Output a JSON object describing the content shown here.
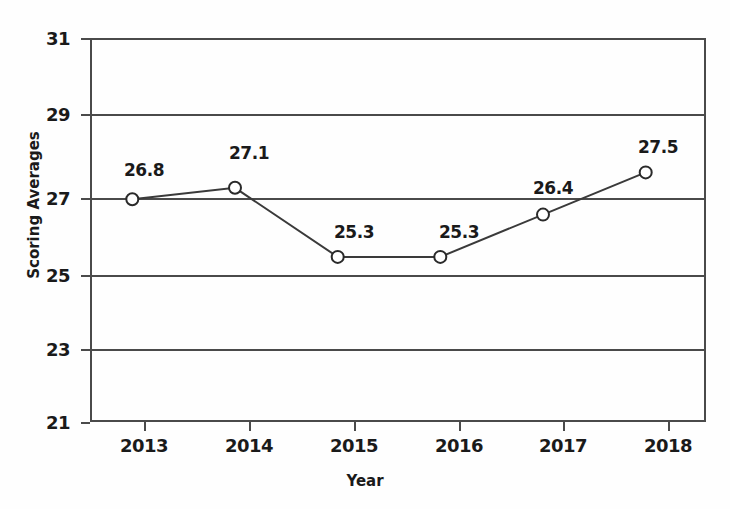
{
  "chart_data": {
    "type": "line",
    "title": "",
    "xlabel": "Year",
    "ylabel": "Scoring Averages",
    "categories": [
      "2013",
      "2014",
      "2015",
      "2016",
      "2017",
      "2018"
    ],
    "values": [
      26.8,
      27.1,
      25.3,
      25.3,
      26.4,
      27.5
    ],
    "point_labels": [
      "26.8",
      "27.1",
      "25.3",
      "25.3",
      "26.4",
      "27.5"
    ],
    "series": [
      {
        "name": "Scoring Averages",
        "values": [
          26.8,
          27.1,
          25.3,
          25.3,
          26.4,
          27.5
        ]
      }
    ],
    "ylim": [
      21,
      31
    ],
    "yticks": [
      21,
      23,
      25,
      27,
      29,
      31
    ],
    "ytick_labels": [
      "21",
      "23",
      "25",
      "27",
      "29",
      "31"
    ],
    "xtick_labels": [
      "2013",
      "2014",
      "2015",
      "2016",
      "2017",
      "2018"
    ],
    "grid": true,
    "grid_axis": "y",
    "legend": false,
    "legend_position": "none",
    "marker": "open-circle",
    "line_color": "#3a3a3a",
    "marker_fill": "#ffffff",
    "marker_edge": "#2a2a2a",
    "axis_color": "#4a4a4a",
    "background_color": "#fefefe",
    "text_color": "#1a1a1a"
  },
  "title_remnant": ""
}
